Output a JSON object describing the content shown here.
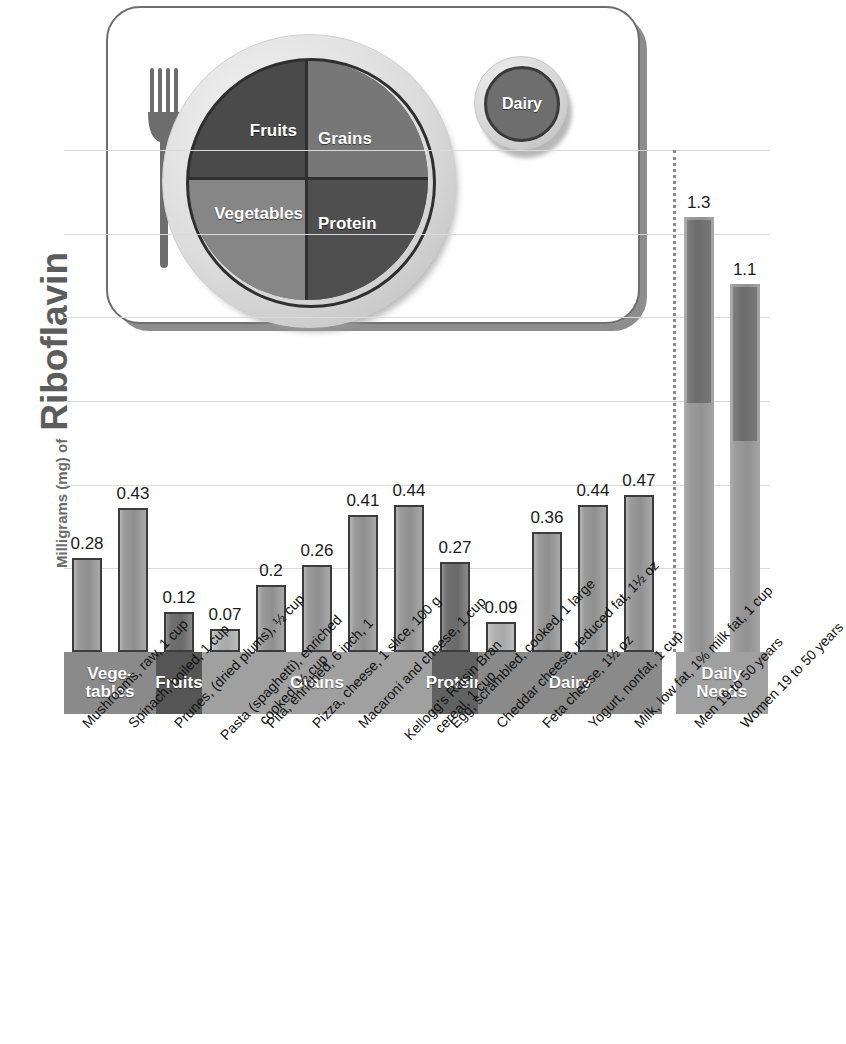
{
  "axis_title": {
    "small": "Milligrams (mg) of",
    "large": "Riboflavin"
  },
  "myplate": {
    "fruits": "Fruits",
    "grains": "Grains",
    "vegetables": "Vegetables",
    "protein": "Protein",
    "dairy": "Dairy"
  },
  "band": [
    {
      "label": "Vege-\ntables",
      "line1": "Vege-",
      "line2": "tables",
      "color": "#8a8a8a",
      "start": 0,
      "count": 2
    },
    {
      "label": "Fruits",
      "line1": "Fruits",
      "line2": "",
      "color": "#555555",
      "start": 2,
      "count": 1
    },
    {
      "label": "Grains",
      "line1": "Grains",
      "line2": "",
      "color": "#a0a0a0",
      "start": 3,
      "count": 5
    },
    {
      "label": "Protein",
      "line1": "Protein",
      "line2": "",
      "color": "#616161",
      "start": 8,
      "count": 1
    },
    {
      "label": "Dairy",
      "line1": "Dairy",
      "line2": "",
      "color": "#8a8a8a",
      "start": 9,
      "count": 4
    },
    {
      "label": "Daily\nNeeds",
      "line1": "Daily",
      "line2": "Needs",
      "color": "#a0a0a0",
      "start": 13,
      "count": 2
    }
  ],
  "chart_data": {
    "type": "bar",
    "title": "Riboflavin",
    "xlabel": "",
    "ylabel": "Milligrams (mg) of Riboflavin",
    "ylim": [
      0,
      1.5
    ],
    "grid": true,
    "gridlines": [
      0.25,
      0.5,
      0.75,
      1.0,
      1.25,
      1.5
    ],
    "legend": "none",
    "annotations": [
      "Dotted divider separates food items from Daily Needs"
    ],
    "categories": [
      "Mushrooms, raw, 1 cup",
      "Spinach, boiled, 1 cup",
      "Prunes, (dried plums), 1/2 cup",
      "Pasta (spaghetti), enriched cooked, 1/2 cup",
      "Pita, enriched, 6 inch, 1",
      "Pizza, cheese, 1 slice, 100 g",
      "Macaroni and cheese, 1 cup",
      "Kellogg's Raisin Bran cereal, 1 cup",
      "Egg, scrambled, cooked, 1 large",
      "Cheddar cheese, reduced fat, 1 1/2 oz",
      "Feta cheese, 1 1/2 oz",
      "Yogurt, nonfat, 1 cup",
      "Milk, low fat, 1% milk fat, 1 cup",
      "Men 19 to 50 years",
      "Women 19 to 50 years"
    ],
    "values": [
      0.28,
      0.43,
      0.12,
      0.07,
      0.2,
      0.26,
      0.41,
      0.44,
      0.27,
      0.09,
      0.36,
      0.44,
      0.47,
      1.3,
      1.1
    ],
    "value_labels": [
      "0.28",
      "0.43",
      "0.12",
      "0.07",
      "0.2",
      "0.26",
      "0.41",
      "0.44",
      "0.27",
      "0.09",
      "0.36",
      "0.44",
      "0.47",
      "1.3",
      "1.1"
    ],
    "groups": [
      "Vegetables",
      "Vegetables",
      "Fruits",
      "Grains",
      "Grains",
      "Grains",
      "Grains",
      "Grains",
      "Protein",
      "Dairy",
      "Dairy",
      "Dairy",
      "Dairy",
      "Daily Needs",
      "Daily Needs"
    ]
  },
  "xtick_labels": [
    {
      "line1": "Mushrooms, raw, 1 cup",
      "line2": ""
    },
    {
      "line1": "Spinach, boiled, 1 cup",
      "line2": ""
    },
    {
      "line1": "Prunes, (dried plums), ½ cup",
      "line2": ""
    },
    {
      "line1": "Pasta (spaghetti), enriched",
      "line2": "cooked, ½ cup"
    },
    {
      "line1": "Pita, enriched, 6 inch, 1",
      "line2": ""
    },
    {
      "line1": "Pizza, cheese, 1 slice, 100 g",
      "line2": ""
    },
    {
      "line1": "Macaroni and cheese, 1 cup",
      "line2": ""
    },
    {
      "line1": "Kellogg's Raisin Bran",
      "line2": "cereal, 1 cup"
    },
    {
      "line1": "Egg, scrambled, cooked, 1 large",
      "line2": ""
    },
    {
      "line1": "Cheddar cheese, reduced fat, 1½ oz",
      "line2": ""
    },
    {
      "line1": "Feta cheese, 1½ oz",
      "line2": ""
    },
    {
      "line1": "Yogurt, nonfat, 1 cup",
      "line2": ""
    },
    {
      "line1": "Milk, low fat, 1% milk fat, 1 cup",
      "line2": ""
    },
    {
      "line1": "Men 19 to 50 years",
      "line2": ""
    },
    {
      "line1": "Women 19 to 50 years",
      "line2": ""
    }
  ],
  "colors": {
    "bar_fill": "#9a9a9a",
    "bar_stroke": "#3c3c3c",
    "grid": "#d9d9d9",
    "band_light": "#a0a0a0",
    "band_mid": "#8a8a8a",
    "band_dark": "#555555",
    "title_gray": "#5c5c5c"
  }
}
